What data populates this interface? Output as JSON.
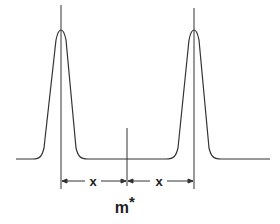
{
  "diagram": {
    "peaks": [
      {
        "name": "left-peak",
        "center_x": 61
      },
      {
        "name": "right-peak",
        "center_x": 194
      }
    ],
    "midpoint_marker_x": 127,
    "dimension_labels": [
      "x",
      "x"
    ],
    "midpoint_label": "m",
    "midpoint_label_superscript": "*",
    "line_color": "#333333"
  }
}
